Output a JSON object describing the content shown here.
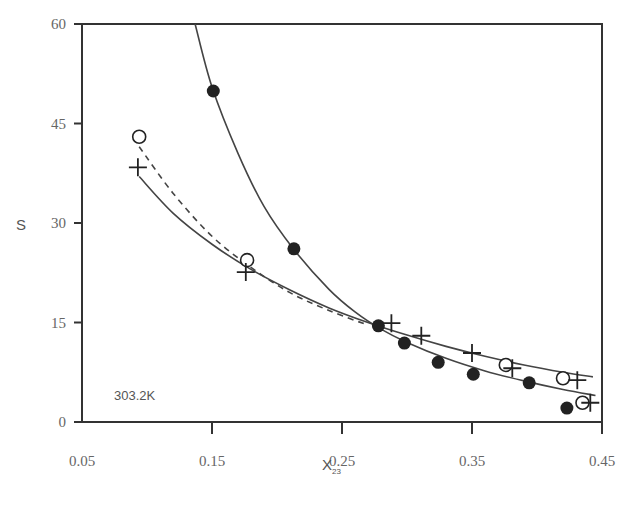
{
  "chart_data": {
    "type": "scatter",
    "title": "",
    "xlabel": "X",
    "xlabel_subscript": "23",
    "ylabel": "S",
    "xlim": [
      0.05,
      0.45
    ],
    "ylim": [
      0,
      60
    ],
    "xticks": [
      "0.05",
      "0.15",
      "0.25",
      "0.35",
      "0.45"
    ],
    "yticks": [
      "0",
      "15",
      "30",
      "45",
      "60"
    ],
    "grid": false,
    "legend": null,
    "annotation": "303.2K",
    "series": [
      {
        "name": "filled circles",
        "marker": "filled-circle",
        "fit_line": "solid",
        "x": [
          0.151,
          0.213,
          0.278,
          0.298,
          0.324,
          0.351,
          0.394,
          0.423
        ],
        "y": [
          49.9,
          26.1,
          14.5,
          11.9,
          9.0,
          7.2,
          5.9,
          2.1
        ]
      },
      {
        "name": "open circles",
        "marker": "open-circle",
        "fit_line": "dashed",
        "x": [
          0.094,
          0.177,
          0.376,
          0.42,
          0.435
        ],
        "y": [
          43.0,
          24.4,
          8.6,
          6.6,
          2.9
        ]
      },
      {
        "name": "plus",
        "marker": "plus",
        "fit_line": "solid",
        "x": [
          0.093,
          0.176,
          0.288,
          0.311,
          0.35,
          0.381,
          0.431,
          0.441
        ],
        "y": [
          38.4,
          22.6,
          14.9,
          13.0,
          10.4,
          8.1,
          6.3,
          2.9
        ]
      }
    ],
    "curves": [
      {
        "name": "filled-fit",
        "style": "solid",
        "x": [
          0.137,
          0.15,
          0.17,
          0.19,
          0.213,
          0.24,
          0.26,
          0.28,
          0.3,
          0.33,
          0.36,
          0.39,
          0.42,
          0.445
        ],
        "y": [
          60,
          50.5,
          40.5,
          32.5,
          26.0,
          20.0,
          16.6,
          14.0,
          12.0,
          9.6,
          7.7,
          6.2,
          4.9,
          4.0
        ]
      },
      {
        "name": "open-fit",
        "style": "dashed",
        "x": [
          0.094,
          0.12,
          0.15,
          0.18,
          0.21,
          0.24,
          0.27
        ],
        "y": [
          41.5,
          34.5,
          28.0,
          23.3,
          19.5,
          16.8,
          14.6
        ]
      },
      {
        "name": "plus-fit",
        "style": "solid",
        "x": [
          0.094,
          0.12,
          0.15,
          0.18,
          0.21,
          0.24,
          0.27,
          0.3,
          0.33,
          0.36,
          0.39,
          0.42,
          0.443
        ],
        "y": [
          37.0,
          31.5,
          26.8,
          23.0,
          19.9,
          17.2,
          15.0,
          13.1,
          11.4,
          9.9,
          8.6,
          7.5,
          6.8
        ]
      }
    ]
  }
}
